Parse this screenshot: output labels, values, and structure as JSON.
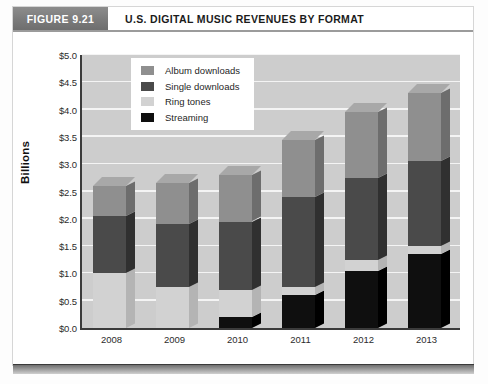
{
  "figure": {
    "tag": "FIGURE 9.21",
    "title": "U.S. DIGITAL MUSIC REVENUES BY FORMAT"
  },
  "chart_data": {
    "type": "bar",
    "subtype": "stacked-column-3d",
    "title": "U.S. DIGITAL MUSIC REVENUES BY FORMAT",
    "xlabel": "",
    "ylabel": "Billions",
    "ylim": [
      0,
      5
    ],
    "ytick_step": 0.5,
    "grid": true,
    "legend_position": "top-left-inside",
    "categories": [
      "2008",
      "2009",
      "2010",
      "2011",
      "2012",
      "2013"
    ],
    "ytick_labels": [
      "$0.0",
      "$0.5",
      "$1.0",
      "$1.5",
      "$2.0",
      "$2.5",
      "$3.0",
      "$3.5",
      "$4.0",
      "$4.5",
      "$5.0"
    ],
    "stack_order_bottom_to_top": [
      "Streaming",
      "Ring tones",
      "Single downloads",
      "Album downloads"
    ],
    "series": [
      {
        "name": "Album downloads",
        "color": "#8f8f8f",
        "side_color": "#6d6d6d",
        "top_color": "#a8a8a8",
        "values": [
          0.55,
          0.75,
          0.85,
          1.05,
          1.2,
          1.25
        ]
      },
      {
        "name": "Single downloads",
        "color": "#4a4a4a",
        "side_color": "#303030",
        "top_color": "#5d5d5d",
        "values": [
          1.05,
          1.15,
          1.25,
          1.65,
          1.5,
          1.55
        ]
      },
      {
        "name": "Ring tones",
        "color": "#d2d2d2",
        "side_color": "#b4b4b4",
        "top_color": "#e2e2e2",
        "values": [
          1.0,
          0.75,
          0.5,
          0.15,
          0.2,
          0.15
        ]
      },
      {
        "name": "Streaming",
        "color": "#0f0f0f",
        "side_color": "#000000",
        "top_color": "#242424",
        "values": [
          0.0,
          0.0,
          0.2,
          0.6,
          1.05,
          1.35
        ]
      }
    ],
    "totals": [
      2.6,
      2.65,
      2.8,
      3.45,
      3.95,
      4.3
    ],
    "plot_background": "#cdcdcd",
    "gridline_color": "#f4f4f4",
    "axis_color": "#3b3b3b"
  },
  "legend": {
    "items": [
      {
        "label": "Album downloads",
        "color": "#8f8f8f"
      },
      {
        "label": "Single downloads",
        "color": "#4a4a4a"
      },
      {
        "label": "Ring tones",
        "color": "#d2d2d2"
      },
      {
        "label": "Streaming",
        "color": "#0f0f0f"
      }
    ]
  }
}
